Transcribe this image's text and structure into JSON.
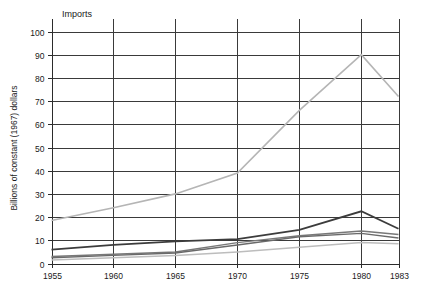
{
  "chart_data": {
    "type": "line",
    "title": "Imports",
    "xlabel": "",
    "ylabel": "Billions of constant (1967) dollars",
    "x": [
      1955,
      1960,
      1965,
      1970,
      1975,
      1980,
      1983
    ],
    "xtick_labels": [
      "1955",
      "1960",
      "1965",
      "1970",
      "1975",
      "1980",
      "1983"
    ],
    "ytick_labels": [
      "0",
      "10",
      "20",
      "30",
      "40",
      "50",
      "60",
      "70",
      "80",
      "90",
      "100"
    ],
    "yticks": [
      0,
      10,
      20,
      30,
      40,
      50,
      60,
      70,
      80,
      90,
      100
    ],
    "xlim": [
      1955,
      1983
    ],
    "ylim": [
      0,
      100
    ],
    "grid": true,
    "legend": "none",
    "series": [
      {
        "name": "series-1",
        "color": "#b5b5b5",
        "width": 1.6,
        "values": [
          18.5,
          24.0,
          30.0,
          39.0,
          66.0,
          90.0,
          72.0
        ]
      },
      {
        "name": "series-2",
        "color": "#3c3c3c",
        "width": 1.8,
        "values": [
          6.0,
          8.0,
          9.5,
          10.5,
          14.5,
          22.5,
          15.0
        ]
      },
      {
        "name": "series-3",
        "color": "#787878",
        "width": 1.5,
        "values": [
          3.0,
          4.0,
          5.0,
          9.0,
          12.0,
          14.0,
          12.5
        ]
      },
      {
        "name": "series-4",
        "color": "#6a6a6a",
        "width": 1.4,
        "values": [
          2.5,
          3.5,
          4.5,
          8.0,
          11.5,
          13.0,
          11.0
        ]
      },
      {
        "name": "series-5",
        "color": "#bdbdbd",
        "width": 1.5,
        "values": [
          1.5,
          2.5,
          3.5,
          5.0,
          7.0,
          9.0,
          8.5
        ]
      }
    ]
  }
}
